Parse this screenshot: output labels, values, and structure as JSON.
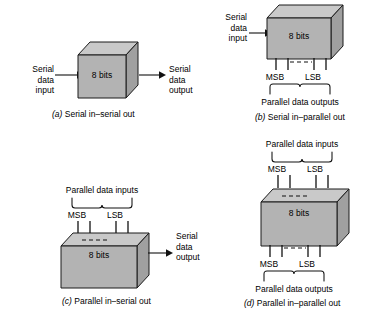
{
  "figure": {
    "box_label": "8 bits",
    "colors": {
      "front_face": "#b3b3b3",
      "top_face": "#c9c9c9",
      "side_face": "#a0a0a0",
      "outline": "#1a1a1a",
      "background": "#ffffff"
    }
  },
  "panels": [
    {
      "id": "a",
      "caption_letter": "(a)",
      "caption_text": "Serial in–serial out",
      "box_label": "8 bits",
      "left_label": "Serial\ndata\ninput",
      "right_label": "Serial\ndata\noutput",
      "top_bracket_label": "",
      "bottom_bracket_label": "",
      "top_msb": "",
      "top_lsb": "",
      "bottom_msb": "",
      "bottom_lsb": ""
    },
    {
      "id": "b",
      "caption_letter": "(b)",
      "caption_text": "Serial in–parallel out",
      "box_label": "8 bits",
      "left_label": "Serial\ndata\ninput",
      "right_label": "",
      "top_bracket_label": "",
      "bottom_bracket_label": "Parallel data outputs",
      "top_msb": "",
      "top_lsb": "",
      "bottom_msb": "MSB",
      "bottom_lsb": "LSB"
    },
    {
      "id": "c",
      "caption_letter": "(c)",
      "caption_text": "Parallel in–serial out",
      "box_label": "8 bits",
      "left_label": "",
      "right_label": "Serial\ndata\noutput",
      "top_bracket_label": "Parallel data inputs",
      "bottom_bracket_label": "",
      "top_msb": "MSB",
      "top_lsb": "LSB",
      "bottom_msb": "",
      "bottom_lsb": ""
    },
    {
      "id": "d",
      "caption_letter": "(d)",
      "caption_text": "Parallel in–parallel out",
      "box_label": "8 bits",
      "left_label": "",
      "right_label": "",
      "top_bracket_label": "Parallel data inputs",
      "bottom_bracket_label": "Parallel data outputs",
      "top_msb": "MSB",
      "top_lsb": "LSB",
      "bottom_msb": "MSB",
      "bottom_lsb": "LSB"
    }
  ]
}
